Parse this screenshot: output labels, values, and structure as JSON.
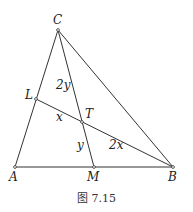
{
  "figure": {
    "caption": "图 7.15",
    "points": {
      "A": {
        "label": "A",
        "x": 15,
        "y": 167
      },
      "B": {
        "label": "B",
        "x": 173,
        "y": 167
      },
      "C": {
        "label": "C",
        "x": 58,
        "y": 30
      },
      "L": {
        "label": "L",
        "x": 36,
        "y": 99
      },
      "M": {
        "label": "M",
        "x": 94,
        "y": 167
      },
      "T": {
        "label": "T",
        "x": 82,
        "y": 122
      }
    },
    "segment_labels": {
      "CT": "2y",
      "TM": "y",
      "LT": "x",
      "TB": "2x"
    }
  }
}
